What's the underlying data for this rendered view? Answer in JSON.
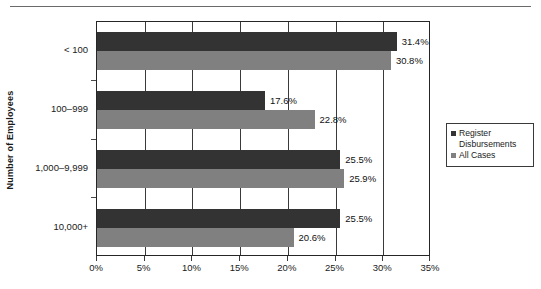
{
  "chart_data": {
    "type": "bar",
    "orientation": "horizontal",
    "title": "",
    "xlabel": "",
    "ylabel": "Number of Employees",
    "categories": [
      "< 100",
      "100–999",
      "1,000–9,999",
      "10,000+"
    ],
    "series": [
      {
        "name": "Register Disbursements",
        "color": "#333333",
        "values": [
          31.4,
          17.6,
          25.5,
          25.5
        ],
        "labels": [
          "31.4%",
          "17.6%",
          "25.5%",
          "25.5%"
        ]
      },
      {
        "name": "All Cases",
        "color": "#808080",
        "values": [
          30.8,
          22.8,
          25.9,
          20.6
        ],
        "labels": [
          "30.8%",
          "22.8%",
          "25.9%",
          "20.6%"
        ]
      }
    ],
    "xlim": [
      0,
      35
    ],
    "xticks": [
      0,
      5,
      10,
      15,
      20,
      25,
      30,
      35
    ],
    "xtick_labels": [
      "0%",
      "5%",
      "10%",
      "15%",
      "20%",
      "25%",
      "30%",
      "35%"
    ],
    "grid": "vertical",
    "legend_position": "right"
  },
  "legend": {
    "entries": [
      {
        "label": "Register Disbursements",
        "color": "#333333"
      },
      {
        "label": "All Cases",
        "color": "#808080"
      }
    ]
  }
}
